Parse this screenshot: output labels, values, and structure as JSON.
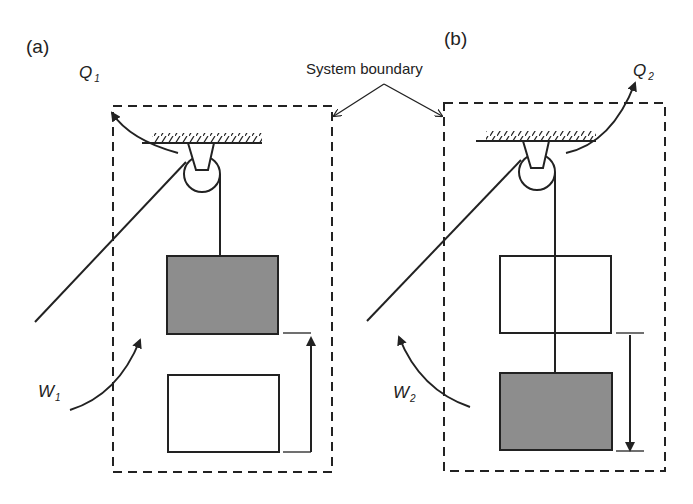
{
  "panels": {
    "a": {
      "label": "(a)",
      "heat": {
        "symbol": "Q",
        "subscript": "1"
      },
      "work": {
        "symbol": "W",
        "subscript": "1"
      },
      "shaded_block": "upper",
      "motion": "up"
    },
    "b": {
      "label": "(b)",
      "heat": {
        "symbol": "Q",
        "subscript": "2"
      },
      "work": {
        "symbol": "W",
        "subscript": "2"
      },
      "shaded_block": "lower",
      "motion": "down"
    }
  },
  "annotation": {
    "system_boundary": "System boundary"
  },
  "colors": {
    "stroke": "#222222",
    "shaded_block": "#8d8d8d",
    "background": "#ffffff"
  }
}
